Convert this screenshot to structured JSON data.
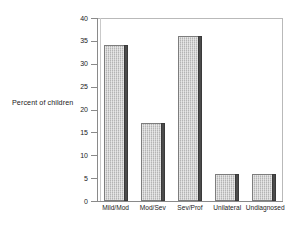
{
  "chart_data": {
    "type": "bar",
    "title": "",
    "xlabel": "",
    "ylabel": "Percent of children",
    "categories": [
      "Mild/Mod",
      "Mod/Sev",
      "Sev/Prof",
      "Unilateral",
      "Undiagnosed"
    ],
    "values": [
      34,
      17,
      36,
      5.8,
      5.8
    ],
    "ylim": [
      0,
      40
    ],
    "yticks": [
      0,
      5,
      10,
      15,
      20,
      25,
      30,
      35,
      40
    ],
    "ytick_labels": [
      "0",
      "5",
      "10",
      "15",
      "20",
      "25",
      "30",
      "35",
      "40"
    ],
    "grid": false,
    "legend": null,
    "colors": {
      "bar_face": "#b4b4b4",
      "bar_side": "#4c4c4c",
      "bar_edge": "#7d7d7d",
      "axis": "#8a8a8a",
      "frame": "#b9b9b9",
      "text": "#1a1a1a",
      "background": "#ffffff"
    }
  }
}
